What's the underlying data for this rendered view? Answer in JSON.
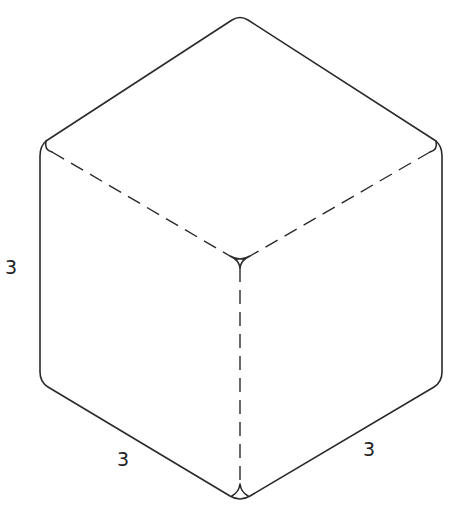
{
  "diagram": {
    "type": "isometric-cube",
    "colors": {
      "stroke": "#2a2a2a",
      "background": "#ffffff"
    },
    "labels": {
      "height": "3",
      "left_width": "3",
      "right_depth": "3"
    }
  }
}
